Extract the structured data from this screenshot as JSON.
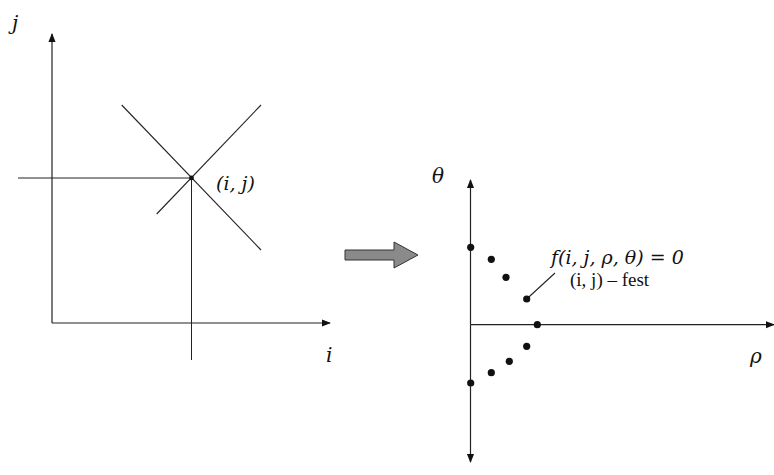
{
  "left_panel": {
    "x_axis_label": "i",
    "y_axis_label": "j",
    "point_label": "(i, j)"
  },
  "arrow": {
    "fill": "#8a8a8a",
    "stroke": "#333333"
  },
  "right_panel": {
    "x_axis_label": "ρ",
    "y_axis_label": "θ",
    "equation_label": "f(i, j, ρ, θ) = 0",
    "annotation_label": "(i, j) – fest",
    "points": [
      {
        "x": 470.7,
        "y": 247.3
      },
      {
        "x": 491.3,
        "y": 259.3
      },
      {
        "x": 506.0,
        "y": 277.3
      },
      {
        "x": 526.7,
        "y": 299.0
      },
      {
        "x": 537.3,
        "y": 324.7
      },
      {
        "x": 526.7,
        "y": 346.3
      },
      {
        "x": 509.3,
        "y": 361.3
      },
      {
        "x": 491.3,
        "y": 372.7
      },
      {
        "x": 470.7,
        "y": 383.0
      }
    ]
  }
}
